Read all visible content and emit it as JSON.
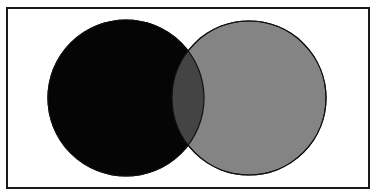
{
  "diagram": {
    "type": "venn",
    "frame": {
      "x": 7,
      "y": 8,
      "width": 362,
      "height": 180,
      "stroke": "#1a1a1a",
      "stroke_width": 2
    },
    "sets": [
      {
        "name": "left-circle",
        "cx": 126,
        "cy": 98,
        "r": 78,
        "fill": "#050505",
        "stroke": "#000000"
      },
      {
        "name": "right-circle",
        "cx": 249,
        "cy": 98,
        "r": 77,
        "fill": "#848484",
        "stroke": "#111111"
      }
    ],
    "intersection": {
      "fill": "#444444",
      "stroke": "#111111"
    }
  }
}
